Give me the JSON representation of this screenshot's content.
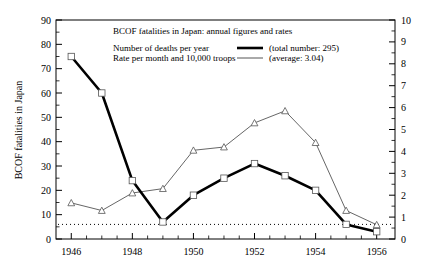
{
  "chart_data": {
    "type": "line",
    "title": "BCOF fatalities in Japan: annual figures and rates",
    "xlabel": "",
    "ylabel": "BCOF fatalities in Japan",
    "y2label": "",
    "grid": false,
    "legend_position": "top-inside",
    "x": [
      1946,
      1947,
      1948,
      1949,
      1950,
      1951,
      1952,
      1953,
      1954,
      1955,
      1956
    ],
    "categories": [
      "1946",
      "1947",
      "1948",
      "1949",
      "1950",
      "1951",
      "1952",
      "1953",
      "1954",
      "1955",
      "1956"
    ],
    "xtick_labels": [
      "1946",
      "1948",
      "1950",
      "1952",
      "1954",
      "1956"
    ],
    "xtick_values": [
      1946,
      1948,
      1950,
      1952,
      1954,
      1956
    ],
    "xlim": [
      1945.5,
      1956.6
    ],
    "ylim": [
      0,
      90
    ],
    "y2lim": [
      0,
      10
    ],
    "ytick_labels": [
      "0",
      "10",
      "20",
      "30",
      "40",
      "50",
      "60",
      "70",
      "80",
      "90"
    ],
    "ytick_values": [
      0,
      10,
      20,
      30,
      40,
      50,
      60,
      70,
      80,
      90
    ],
    "y2tick_labels": [
      "0",
      "1",
      "2",
      "3",
      "4",
      "5",
      "6",
      "7",
      "8",
      "9",
      "10"
    ],
    "y2tick_values": [
      0,
      1,
      2,
      3,
      4,
      5,
      6,
      7,
      8,
      9,
      10
    ],
    "series": [
      {
        "name": "Number of deaths per year",
        "axis": "left",
        "style": "thick-line-square-markers",
        "annotation": "(total number: 295)",
        "values": [
          75,
          60,
          24,
          7,
          18,
          25,
          31,
          26,
          20,
          6,
          3
        ]
      },
      {
        "name": "Rate per month and 10,000 troops",
        "axis": "right",
        "style": "thin-line-triangle-markers",
        "annotation": "(average: 3.04)",
        "values": [
          1.65,
          1.3,
          2.1,
          2.3,
          4.05,
          4.2,
          5.3,
          5.85,
          4.4,
          1.3,
          0.65
        ]
      }
    ],
    "reference_line": {
      "name": "average-rate-dotted-line",
      "axis": "left",
      "value": 6,
      "style": "dotted"
    }
  },
  "legend": {
    "title": "BCOF fatalities in Japan: annual figures and rates",
    "rows": [
      {
        "label": "Number of deaths per year",
        "note": "(total number: 295)"
      },
      {
        "label": "Rate per month and 10,000 troops",
        "note": "(average: 3.04)"
      }
    ]
  },
  "axes": {
    "left_title": "BCOF fatalities in Japan"
  },
  "colors": {
    "thick_series": "#000000",
    "thin_series": "#555555",
    "axis": "#000000",
    "background": "#ffffff"
  }
}
